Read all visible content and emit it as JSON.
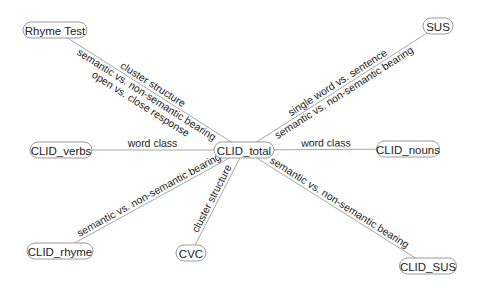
{
  "diagram": {
    "type": "network-graph",
    "center_node": "CLID_total",
    "nodes": [
      {
        "id": "rhyme_test",
        "label": "Rhyme Test",
        "x": 55,
        "y": 30,
        "w": 64
      },
      {
        "id": "sus",
        "label": "SUS",
        "x": 438,
        "y": 26,
        "w": 30
      },
      {
        "id": "clid_total",
        "label": "CLID_total",
        "x": 244,
        "y": 150,
        "w": 60
      },
      {
        "id": "clid_verbs",
        "label": "CLID_verbs",
        "x": 61,
        "y": 150,
        "w": 62
      },
      {
        "id": "clid_nouns",
        "label": "CLID_nouns",
        "x": 408,
        "y": 149,
        "w": 63
      },
      {
        "id": "clid_rhyme",
        "label": "CLID_rhyme",
        "x": 60,
        "y": 251,
        "w": 66
      },
      {
        "id": "cvc",
        "label": "CVC",
        "x": 191,
        "y": 253,
        "w": 30
      },
      {
        "id": "clid_sus",
        "label": "CLID_SUS",
        "x": 428,
        "y": 266,
        "w": 57
      }
    ],
    "edges": [
      {
        "from": "clid_total",
        "to": "rhyme_test",
        "labels": [
          "cluster structure",
          "semantic vs. non-semantic bearing",
          "open vs. close response"
        ]
      },
      {
        "from": "clid_total",
        "to": "sus",
        "labels": [
          "single word vs. sentence",
          "semantic vs. non-semantic bearing"
        ]
      },
      {
        "from": "clid_total",
        "to": "clid_verbs",
        "labels": [
          "word class"
        ]
      },
      {
        "from": "clid_total",
        "to": "clid_nouns",
        "labels": [
          "word class"
        ]
      },
      {
        "from": "clid_total",
        "to": "clid_rhyme",
        "labels": [
          "semantic vs. non-semantic bearing"
        ]
      },
      {
        "from": "clid_total",
        "to": "cvc",
        "labels": [
          "cluster structure"
        ]
      },
      {
        "from": "clid_total",
        "to": "clid_sus",
        "labels": [
          "semantic vs. non-semantic bearing"
        ]
      }
    ]
  },
  "colors": {
    "edge": "#a8a8a8",
    "node_border": "#9a9a9a",
    "text": "#222222",
    "background": "#ffffff"
  }
}
